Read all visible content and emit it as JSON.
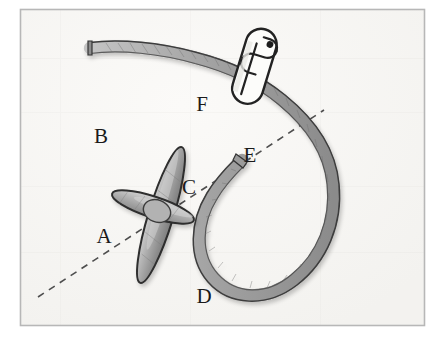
{
  "figure": {
    "canvas": {
      "width": 439,
      "height": 341
    },
    "colors": {
      "page_background": "#ffffff",
      "panel_background": "#f7f6f4",
      "frame_border": "#b7b7b7",
      "strap_fill": "#a3a3a3",
      "strap_fill_light": "#bdbdbd",
      "strap_outline": "#3a3a3a",
      "rod_fill": "#9a9a9a",
      "rod_fill_light": "#c3c3c3",
      "rod_outline": "#2e2e2e",
      "clip_fill": "#fdfdfd",
      "clip_outline": "#222222",
      "dashed_line": "#555555",
      "label_text": "#1a1a1a"
    },
    "frame": {
      "x": 20,
      "y": 9,
      "width": 405,
      "height": 317,
      "stroke_width": 1.5
    },
    "labels": [
      {
        "id": "label-a",
        "text": "A",
        "x": 104,
        "y": 243
      },
      {
        "id": "label-b",
        "text": "B",
        "x": 101,
        "y": 143
      },
      {
        "id": "label-c",
        "text": "C",
        "x": 189,
        "y": 194
      },
      {
        "id": "label-d",
        "text": "D",
        "x": 204,
        "y": 303
      },
      {
        "id": "label-e",
        "text": "E",
        "x": 250,
        "y": 162
      },
      {
        "id": "label-f",
        "text": "F",
        "x": 202,
        "y": 111
      }
    ],
    "dashed_line": {
      "name": "axis-dashed-line",
      "from": {
        "x": 38,
        "y": 297
      },
      "to": {
        "x": 324,
        "y": 110
      },
      "dash_pattern": "7 6",
      "stroke_width": 1.6
    },
    "crossed_rods": {
      "name": "crossed-rod-marker",
      "rod_bd": {
        "label_start": "B",
        "label_end": "D",
        "cx": 161,
        "cy": 215,
        "rx": 13,
        "ry": 71,
        "rotation_deg": 17
      },
      "rod_ac": {
        "label_start": "A",
        "label_end": "C",
        "cx": 153,
        "cy": 207,
        "rx": 11,
        "ry": 43,
        "rotation_deg": 108
      }
    },
    "strap": {
      "name": "looped-strap",
      "free_end": {
        "x": 90,
        "y": 48
      },
      "loop_center": {
        "x": 325,
        "y": 205
      },
      "loop_radius": 84,
      "width": 11
    },
    "paperclip": {
      "name": "paperclip",
      "anchor_label": "F",
      "cx": 255,
      "cy": 66,
      "length": 68,
      "width": 18,
      "rotation_deg": 17
    }
  }
}
